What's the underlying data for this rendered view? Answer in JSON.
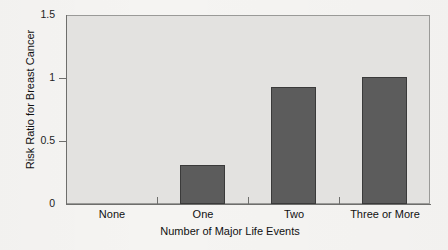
{
  "chart_data": {
    "type": "bar",
    "title": "",
    "subtitle": "",
    "xlabel": "Number of Major Life Events",
    "ylabel": "Risk Ratio for Breast Cancer",
    "categories": [
      "None",
      "One",
      "Two",
      "Three or More"
    ],
    "values": [
      0,
      0.31,
      0.93,
      1.01
    ],
    "series": [
      {
        "name": "Risk Ratio for Breast Cancer",
        "values": [
          0,
          0.31,
          0.93,
          1.01
        ]
      }
    ],
    "ylim": [
      0,
      1.5
    ],
    "y_ticks": [
      0,
      0.5,
      1,
      1.5
    ],
    "y_tick_labels": [
      "0",
      "0.5",
      "1",
      "1.5"
    ],
    "x_tick_labels": [
      "None",
      "One",
      "Two",
      "Three or More"
    ],
    "grid": false,
    "legend": false,
    "legend_position": "none",
    "bar_color": "#5c5c5c",
    "bar_edge_color": "#3a3a3a",
    "panel_color": "#e3e2e0",
    "page_color": "#f5f4f2",
    "axis_color": "#6e6e6c",
    "text_color": "#111111",
    "annotations": []
  },
  "figure": {
    "background_color": "#f5f4f2"
  }
}
